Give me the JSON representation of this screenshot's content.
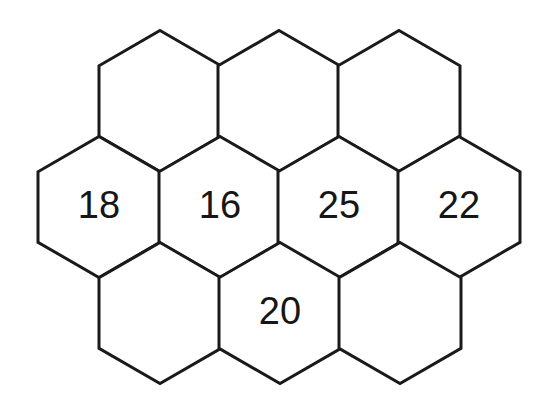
{
  "figure": {
    "background_color": "#ffffff",
    "stroke_color": "#1a1a1a",
    "fill_color": "#ffffff",
    "label_color": "#161616",
    "stroke_width": 3,
    "hex_width": 122,
    "hex_height": 141,
    "rows": [
      {
        "row_name": "top-row",
        "center_y": 101,
        "cells": [
          {
            "id": "top-1",
            "cx": 160,
            "cy": 101,
            "label": ""
          },
          {
            "id": "top-2",
            "cx": 279,
            "cy": 101,
            "label": ""
          },
          {
            "id": "top-3",
            "cx": 399,
            "cy": 101,
            "label": ""
          }
        ]
      },
      {
        "row_name": "middle-row",
        "center_y": 207,
        "cells": [
          {
            "id": "mid-1",
            "cx": 99,
            "cy": 207,
            "label": "18"
          },
          {
            "id": "mid-2",
            "cx": 220,
            "cy": 207,
            "label": "16"
          },
          {
            "id": "mid-3",
            "cx": 339,
            "cy": 207,
            "label": "25"
          },
          {
            "id": "mid-4",
            "cx": 459,
            "cy": 207,
            "label": "22"
          }
        ]
      },
      {
        "row_name": "bottom-row",
        "center_y": 313,
        "cells": [
          {
            "id": "bot-1",
            "cx": 160,
            "cy": 313,
            "label": ""
          },
          {
            "id": "bot-2",
            "cx": 280,
            "cy": 313,
            "label": "20"
          },
          {
            "id": "bot-3",
            "cx": 400,
            "cy": 313,
            "label": ""
          }
        ]
      }
    ],
    "labels": [
      "18",
      "16",
      "25",
      "22",
      "20"
    ],
    "label_count": 5,
    "cell_count": 10
  }
}
